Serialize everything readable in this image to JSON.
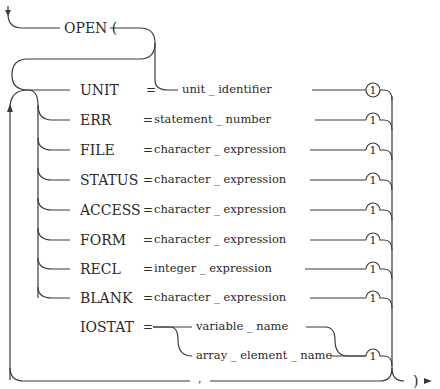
{
  "diagram": {
    "title": "OPEN (",
    "closing": ")",
    "separator": ",",
    "equals": "=",
    "footnote_marker": "1",
    "params": [
      {
        "keyword": "UNIT",
        "value": "unit _ identifier"
      },
      {
        "keyword": "ERR",
        "value": "statement _ number"
      },
      {
        "keyword": "FILE",
        "value": "character _ expression"
      },
      {
        "keyword": "STATUS",
        "value": "character _ expression"
      },
      {
        "keyword": "ACCESS",
        "value": "character _ expression"
      },
      {
        "keyword": "FORM",
        "value": "character _ expression"
      },
      {
        "keyword": "RECL",
        "value": "integer _ expression"
      },
      {
        "keyword": "BLANK",
        "value": "character _ expression"
      },
      {
        "keyword": "IOSTAT",
        "value": "variable _ name",
        "alt_value": "array _ element _ name"
      }
    ]
  }
}
